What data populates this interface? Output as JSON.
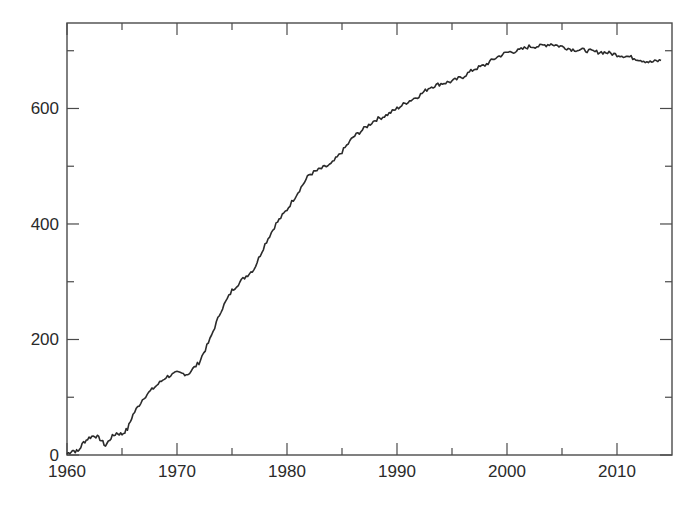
{
  "chart_data": {
    "type": "line",
    "title": "",
    "xlabel": "",
    "ylabel": "",
    "xlim": [
      1960,
      2015
    ],
    "ylim": [
      0,
      748
    ],
    "grid": false,
    "legend": null,
    "x_ticks": [
      1960,
      1970,
      1980,
      1990,
      2000,
      2010
    ],
    "x_minor_ticks": [
      1965,
      1975,
      1985,
      1995,
      2005
    ],
    "y_ticks": [
      0,
      200,
      400,
      600
    ],
    "y_minor_ticks": [
      100,
      300,
      500,
      700
    ],
    "series": [
      {
        "name": "series-1",
        "color": "#2b2b2b",
        "x": [
          1960.0,
          1960.5,
          1961.0,
          1961.5,
          1962.0,
          1962.5,
          1963.0,
          1963.5,
          1964.0,
          1964.5,
          1965.0,
          1965.5,
          1966.0,
          1967.0,
          1968.0,
          1969.0,
          1970.0,
          1971.0,
          1972.0,
          1973.0,
          1974.0,
          1975.0,
          1976.0,
          1977.0,
          1978.0,
          1979.0,
          1980.0,
          1981.0,
          1982.0,
          1983.0,
          1984.0,
          1985.0,
          1986.0,
          1987.0,
          1988.0,
          1989.0,
          1990.0,
          1991.0,
          1992.0,
          1993.0,
          1994.0,
          1995.0,
          1996.0,
          1997.0,
          1998.0,
          1999.0,
          2000.0,
          2001.0,
          2002.0,
          2003.0,
          2004.0,
          2005.0,
          2006.0,
          2007.0,
          2008.0,
          2009.0,
          2010.0,
          2011.0,
          2012.0,
          2013.0,
          2014.0
        ],
        "values": [
          2,
          8,
          6,
          22,
          30,
          34,
          28,
          16,
          30,
          38,
          36,
          45,
          70,
          100,
          118,
          135,
          142,
          140,
          160,
          200,
          250,
          285,
          305,
          322,
          365,
          400,
          425,
          455,
          485,
          495,
          503,
          525,
          550,
          565,
          580,
          588,
          600,
          612,
          622,
          637,
          643,
          647,
          655,
          668,
          675,
          688,
          697,
          700,
          707,
          708,
          712,
          707,
          702,
          701,
          698,
          697,
          693,
          690,
          685,
          680,
          683
        ]
      }
    ]
  },
  "axes": {
    "x_tick_labels": [
      "1960",
      "1970",
      "1980",
      "1990",
      "2000",
      "2010"
    ],
    "y_tick_labels": [
      "0",
      "200",
      "400",
      "600"
    ]
  }
}
